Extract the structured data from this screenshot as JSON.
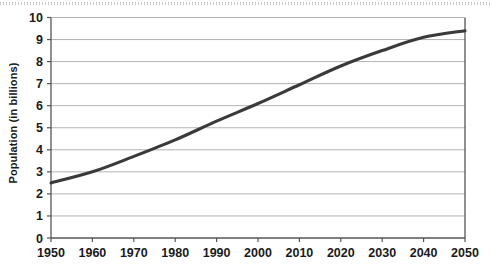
{
  "chart_data": {
    "type": "line",
    "title": "",
    "xlabel": "",
    "ylabel": "Population (in billions)",
    "x": [
      1950,
      1960,
      1970,
      1980,
      1990,
      2000,
      2010,
      2020,
      2030,
      2040,
      2050
    ],
    "values": [
      2.5,
      3.0,
      3.7,
      4.45,
      5.3,
      6.1,
      6.95,
      7.8,
      8.5,
      9.1,
      9.4
    ],
    "series": [
      {
        "name": "World population",
        "values": [
          2.5,
          3.0,
          3.7,
          4.45,
          5.3,
          6.1,
          6.95,
          7.8,
          8.5,
          9.1,
          9.4
        ]
      }
    ],
    "xlim": [
      1950,
      2050
    ],
    "ylim": [
      0,
      10
    ],
    "xticks": [
      "1950",
      "1960",
      "1970",
      "1980",
      "1990",
      "2000",
      "2010",
      "2020",
      "2030",
      "2040",
      "2050"
    ],
    "yticks": [
      "0",
      "1",
      "2",
      "3",
      "4",
      "5",
      "6",
      "7",
      "8",
      "9",
      "10"
    ],
    "grid": "horizontal",
    "legend": "none",
    "line_color": "#3a3a3a",
    "grid_color": "#b3b3b3",
    "axis_color": "#555555"
  },
  "axis": {
    "y_title": "Population (in billions)"
  }
}
